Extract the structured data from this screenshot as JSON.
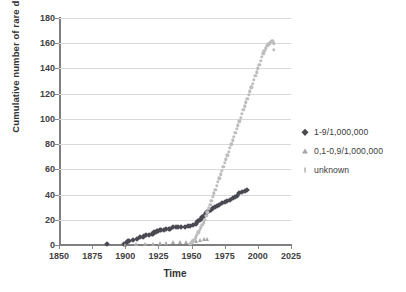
{
  "chart_data": {
    "type": "scatter",
    "title": "",
    "xlabel": "Time",
    "ylabel": "Cumulative number of rare disorders",
    "xlim": [
      1850,
      2025
    ],
    "ylim": [
      0,
      180
    ],
    "xticks": [
      1850,
      1875,
      1900,
      1925,
      1950,
      1975,
      2000,
      2025
    ],
    "yticks": [
      0,
      20,
      40,
      60,
      80,
      100,
      120,
      140,
      160,
      180
    ],
    "grid": "horizontal",
    "legend_position": "right",
    "colors": {
      "series_1": "#4a4a52",
      "series_2": "#a6a6a6",
      "series_3": "#bdbdbd",
      "gridline": "#d9d9d9",
      "axis": "#7f7f7f"
    },
    "series": [
      {
        "name": "1-9/1,000,000",
        "marker": "diamond",
        "color": "#4a4a52",
        "points": [
          [
            1886,
            0.5
          ],
          [
            1899,
            1
          ],
          [
            1901,
            2
          ],
          [
            1902,
            3
          ],
          [
            1903,
            3
          ],
          [
            1906,
            4
          ],
          [
            1909,
            5
          ],
          [
            1911,
            6
          ],
          [
            1913,
            6
          ],
          [
            1914,
            7
          ],
          [
            1916,
            8
          ],
          [
            1918,
            8
          ],
          [
            1920,
            9
          ],
          [
            1921,
            9
          ],
          [
            1922,
            10
          ],
          [
            1923,
            10
          ],
          [
            1924,
            11
          ],
          [
            1925,
            11
          ],
          [
            1926,
            12
          ],
          [
            1927,
            12
          ],
          [
            1929,
            12
          ],
          [
            1931,
            13
          ],
          [
            1933,
            13
          ],
          [
            1934,
            13
          ],
          [
            1936,
            14
          ],
          [
            1938,
            14
          ],
          [
            1940,
            14
          ],
          [
            1942,
            14
          ],
          [
            1945,
            14
          ],
          [
            1947,
            15
          ],
          [
            1949,
            15
          ],
          [
            1951,
            16
          ],
          [
            1953,
            17
          ],
          [
            1954,
            18
          ],
          [
            1955,
            19
          ],
          [
            1956,
            20
          ],
          [
            1957,
            21
          ],
          [
            1958,
            22
          ],
          [
            1959,
            23
          ],
          [
            1960,
            24
          ],
          [
            1961,
            25
          ],
          [
            1962,
            26
          ],
          [
            1963,
            27
          ],
          [
            1965,
            28
          ],
          [
            1966,
            29
          ],
          [
            1968,
            30
          ],
          [
            1969,
            31
          ],
          [
            1971,
            32
          ],
          [
            1973,
            33
          ],
          [
            1975,
            34
          ],
          [
            1977,
            35
          ],
          [
            1979,
            36
          ],
          [
            1981,
            37
          ],
          [
            1983,
            38
          ],
          [
            1984,
            39
          ],
          [
            1986,
            41
          ],
          [
            1988,
            42
          ],
          [
            1990,
            43
          ],
          [
            1992,
            44
          ]
        ]
      },
      {
        "name": "0,1-0,9/1,000,000",
        "marker": "triangle",
        "color": "#a6a6a6",
        "points": [
          [
            1900,
            0.3
          ],
          [
            1908,
            0.5
          ],
          [
            1915,
            0.8
          ],
          [
            1921,
            1
          ],
          [
            1926,
            1.2
          ],
          [
            1931,
            1.5
          ],
          [
            1936,
            2
          ],
          [
            1941,
            2.2
          ],
          [
            1946,
            2.5
          ],
          [
            1950,
            3
          ],
          [
            1953,
            3.5
          ],
          [
            1956,
            4
          ],
          [
            1959,
            4.5
          ],
          [
            1962,
            5
          ]
        ]
      },
      {
        "name": "unknown",
        "marker": "dot",
        "color": "#bdbdbd",
        "points": [
          [
            1949,
            1
          ],
          [
            1950,
            2
          ],
          [
            1951,
            3
          ],
          [
            1952,
            4
          ],
          [
            1953,
            6
          ],
          [
            1954,
            8
          ],
          [
            1955,
            10
          ],
          [
            1956,
            12
          ],
          [
            1957,
            14
          ],
          [
            1958,
            16
          ],
          [
            1959,
            18
          ],
          [
            1960,
            20
          ],
          [
            1961,
            23
          ],
          [
            1962,
            26
          ],
          [
            1963,
            29
          ],
          [
            1964,
            32
          ],
          [
            1965,
            35
          ],
          [
            1966,
            38
          ],
          [
            1967,
            41
          ],
          [
            1968,
            44
          ],
          [
            1969,
            47
          ],
          [
            1970,
            50
          ],
          [
            1971,
            53
          ],
          [
            1972,
            56
          ],
          [
            1973,
            59
          ],
          [
            1974,
            62
          ],
          [
            1975,
            65
          ],
          [
            1976,
            68
          ],
          [
            1977,
            71
          ],
          [
            1978,
            74
          ],
          [
            1979,
            77
          ],
          [
            1980,
            80
          ],
          [
            1981,
            83
          ],
          [
            1982,
            86
          ],
          [
            1983,
            89
          ],
          [
            1984,
            92
          ],
          [
            1985,
            95
          ],
          [
            1986,
            98
          ],
          [
            1987,
            101
          ],
          [
            1988,
            104
          ],
          [
            1989,
            107
          ],
          [
            1990,
            110
          ],
          [
            1991,
            113
          ],
          [
            1992,
            116
          ],
          [
            1993,
            119
          ],
          [
            1994,
            122
          ],
          [
            1995,
            125
          ],
          [
            1996,
            128
          ],
          [
            1997,
            131
          ],
          [
            1998,
            134
          ],
          [
            1999,
            137
          ],
          [
            2000,
            140
          ],
          [
            2001,
            143
          ],
          [
            2002,
            146
          ],
          [
            2003,
            149
          ],
          [
            2004,
            152
          ],
          [
            2005,
            154
          ],
          [
            2006,
            156
          ],
          [
            2007,
            158
          ],
          [
            2008,
            159
          ],
          [
            2009,
            160
          ],
          [
            2010,
            161
          ],
          [
            2011,
            162
          ],
          [
            2012,
            160
          ],
          [
            2012,
            155
          ]
        ]
      }
    ]
  },
  "axes": {
    "y_title": "Cumulative number of rare disorders",
    "x_title": "Time"
  },
  "legend": {
    "items": [
      {
        "label": "1-9/1,000,000",
        "marker": "diamond"
      },
      {
        "label": "0,1-0,9/1,000,000",
        "marker": "triangle"
      },
      {
        "label": "unknown",
        "marker": "tick"
      }
    ]
  }
}
